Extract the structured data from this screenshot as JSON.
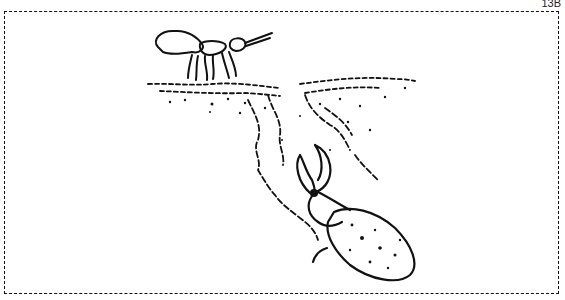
{
  "figure": {
    "label": "13B",
    "elements": [
      "insect-on-surface",
      "ground-surface",
      "burrow-tunnel",
      "beetle-in-burrow"
    ],
    "border_style": "dashed"
  }
}
